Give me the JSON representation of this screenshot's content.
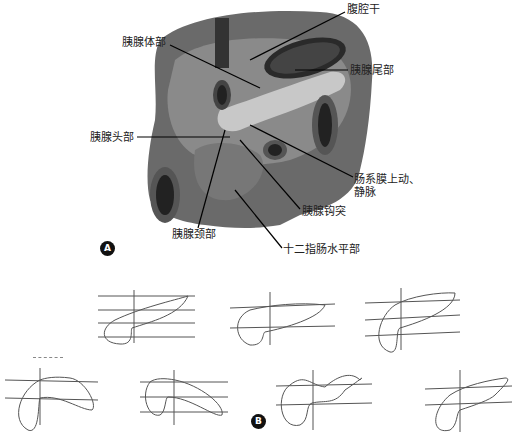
{
  "figure_a": {
    "badge": "A",
    "labels": {
      "celiac_trunk": "腹腔干",
      "pancreas_body": "胰腺体部",
      "pancreas_tail": "胰腺尾部",
      "pancreas_head": "胰腺头部",
      "sma_smv_line1": "肠系膜上动、",
      "sma_smv_line2": "静脉",
      "uncinate_process": "胰腺钩突",
      "pancreas_neck": "胰腺颈部",
      "duodenum_horizontal": "十二指肠水平部"
    }
  },
  "figure_b": {
    "badge": "B",
    "shape_count": 7
  }
}
